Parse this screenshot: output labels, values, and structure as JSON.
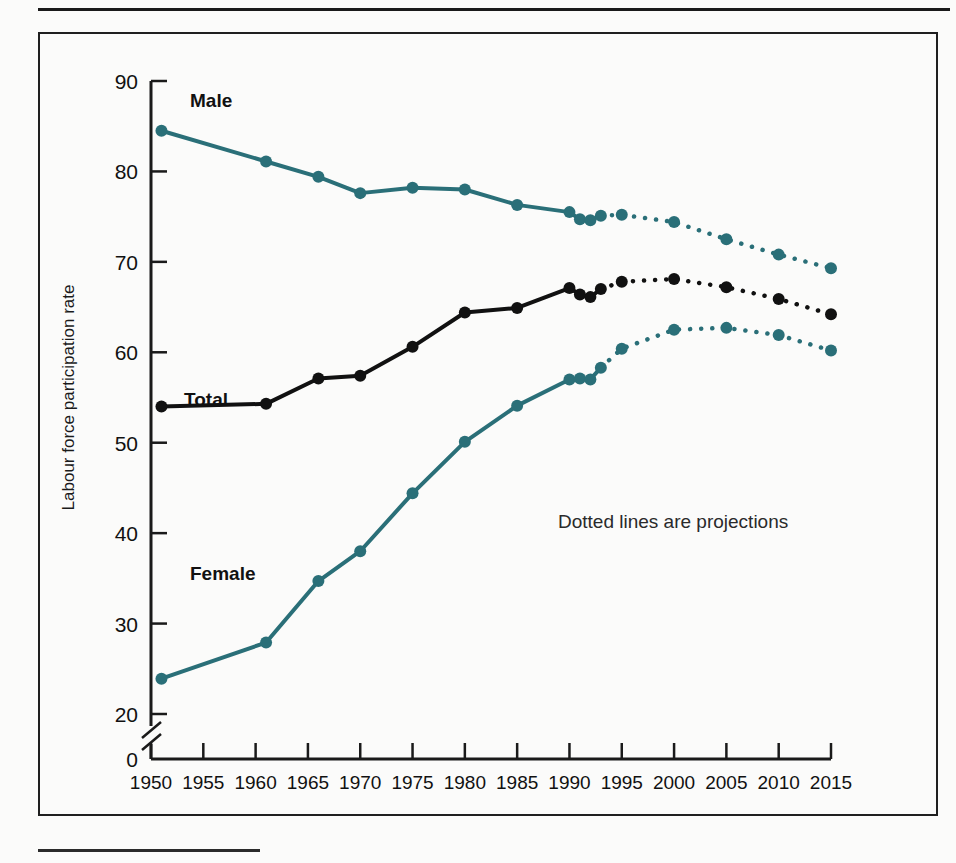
{
  "figure": {
    "ylabel": "Labour force participation rate",
    "note": "Dotted lines are projections",
    "label_male": "Male",
    "label_total": "Total",
    "label_female": "Female",
    "color_teal": "#2a6f78",
    "color_black": "#111111"
  },
  "chart_data": {
    "type": "line",
    "title": "",
    "xlabel": "",
    "ylabel": "Labour force participation rate",
    "note": "Dotted lines are projections",
    "grid": false,
    "legend": "inline-labels",
    "xlim": [
      1950,
      2015
    ],
    "ylim": [
      20,
      90
    ],
    "y_axis_break": {
      "between": [
        0,
        20
      ],
      "zero_tick_shown": true
    },
    "xticks": [
      1950,
      1955,
      1960,
      1965,
      1970,
      1975,
      1980,
      1985,
      1990,
      1995,
      2000,
      2005,
      2010,
      2015
    ],
    "yticks": [
      0,
      20,
      30,
      40,
      50,
      60,
      70,
      80,
      90
    ],
    "projection_starts_year": 1993,
    "series": [
      {
        "name": "Male",
        "color": "#2a6f78",
        "style": "solid-then-dotted",
        "x": [
          1951,
          1961,
          1966,
          1970,
          1975,
          1980,
          1985,
          1990,
          1991,
          1992,
          1993,
          1995,
          2000,
          2005,
          2010,
          2015
        ],
        "values": [
          84.5,
          81.1,
          79.4,
          77.6,
          78.2,
          78.0,
          76.3,
          75.5,
          74.7,
          74.6,
          75.1,
          75.2,
          74.4,
          72.5,
          70.8,
          69.3
        ]
      },
      {
        "name": "Total",
        "color": "#111111",
        "style": "solid-then-dotted",
        "x": [
          1951,
          1961,
          1966,
          1970,
          1975,
          1980,
          1985,
          1990,
          1991,
          1992,
          1993,
          1995,
          2000,
          2005,
          2010,
          2015
        ],
        "values": [
          54.0,
          54.3,
          57.1,
          57.4,
          60.6,
          64.4,
          64.9,
          67.1,
          66.4,
          66.1,
          67.0,
          67.8,
          68.1,
          67.2,
          65.9,
          64.2
        ]
      },
      {
        "name": "Female",
        "color": "#2a6f78",
        "style": "solid-then-dotted",
        "x": [
          1951,
          1961,
          1966,
          1970,
          1975,
          1980,
          1985,
          1990,
          1991,
          1992,
          1993,
          1995,
          2000,
          2005,
          2010,
          2015
        ],
        "values": [
          23.9,
          27.9,
          34.7,
          38.0,
          44.4,
          50.1,
          54.1,
          57.0,
          57.1,
          57.0,
          58.3,
          60.4,
          62.5,
          62.7,
          61.9,
          60.2
        ]
      }
    ]
  }
}
